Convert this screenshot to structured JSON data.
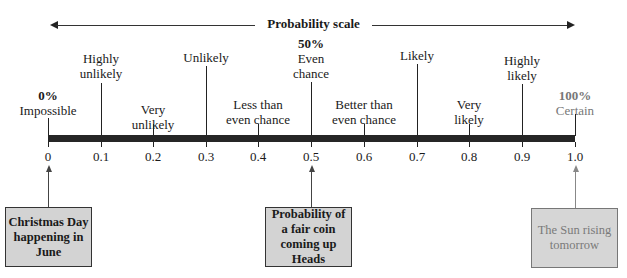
{
  "diagram": {
    "title": "Probability scale",
    "scale": {
      "min": 0,
      "max": 1.0,
      "tick_labels": [
        "0",
        "0.1",
        "0.2",
        "0.3",
        "0.4",
        "0.5",
        "0.6",
        "0.7",
        "0.8",
        "0.9",
        "1.0"
      ]
    },
    "descriptors": [
      {
        "value": 0.0,
        "percent": "0%",
        "label": "Impossible"
      },
      {
        "value": 0.1,
        "line1": "Highly",
        "line2": "unlikely"
      },
      {
        "value": 0.2,
        "line1": "Very",
        "line2": "unlikely"
      },
      {
        "value": 0.3,
        "line1": "Unlikely"
      },
      {
        "value": 0.4,
        "line1": "Less than",
        "line2": "even chance"
      },
      {
        "value": 0.5,
        "percent": "50%",
        "line1": "Even",
        "line2": "chance"
      },
      {
        "value": 0.6,
        "line1": "Better than",
        "line2": "even chance"
      },
      {
        "value": 0.7,
        "line1": "Likely"
      },
      {
        "value": 0.8,
        "line1": "Very",
        "line2": "likely"
      },
      {
        "value": 0.9,
        "line1": "Highly",
        "line2": "likely"
      },
      {
        "value": 1.0,
        "percent": "100%",
        "label": "Certain"
      }
    ],
    "examples": [
      {
        "value": 0,
        "line1": "Christmas Day",
        "line2": "happening in",
        "line3": "June"
      },
      {
        "value": 0.5,
        "line1": "Probability of",
        "line2": "a fair coin",
        "line3": "coming up Heads"
      },
      {
        "value": 1.0,
        "line1": "The Sun rising",
        "line2": "tomorrow"
      }
    ],
    "colors": {
      "bar": "#262626",
      "box_fill": "#d3d3d3",
      "box_border": "#333333",
      "certain_text": "#777777"
    }
  }
}
